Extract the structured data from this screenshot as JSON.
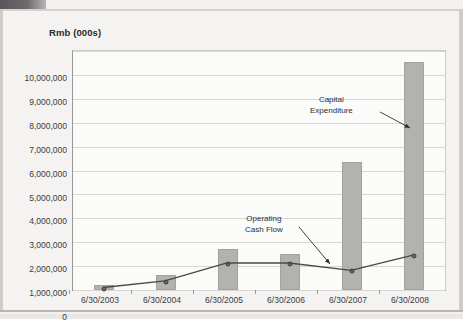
{
  "chart_data": {
    "type": "bar",
    "title": "Rmb (000s)",
    "xlabel": "",
    "ylabel": "",
    "categories": [
      "6/30/2003",
      "6/30/2004",
      "6/30/2005",
      "6/30/2006",
      "6/30/2007",
      "6/30/2008"
    ],
    "ylim": [
      0,
      10000000
    ],
    "ytick_labels": [
      "10,000,000",
      "9,000,000",
      "8,000,000",
      "7,000,000",
      "6,000,000",
      "5,000,000",
      "4,000,000",
      "3,000,000",
      "2,000,000",
      "1,000,000",
      "0"
    ],
    "ytick_values": [
      10000000,
      9000000,
      8000000,
      7000000,
      6000000,
      5000000,
      4000000,
      3000000,
      2000000,
      1000000,
      0
    ],
    "grid": true,
    "legend_position": "none",
    "series": [
      {
        "name": "Capital Expenditure",
        "type": "bar",
        "color": "#b4b2af",
        "values": [
          230000,
          640000,
          1700000,
          1520000,
          5360000,
          9540000
        ]
      },
      {
        "name": "Operating Cash Flow",
        "type": "line",
        "color": "#4a4846",
        "values": [
          60000,
          340000,
          1090000,
          1090000,
          780000,
          1420000
        ]
      }
    ],
    "annotations": [
      {
        "id": "capital-expenditure",
        "text_lines": [
          "Capital",
          "Expenditure"
        ],
        "points_to_series": "Capital Expenditure",
        "points_to_category": "6/30/2008"
      },
      {
        "id": "operating-cash-flow",
        "text_lines": [
          "Operating",
          "Cash Flow"
        ],
        "points_to_series": "Operating Cash Flow",
        "points_to_category": "6/30/2007"
      }
    ]
  }
}
